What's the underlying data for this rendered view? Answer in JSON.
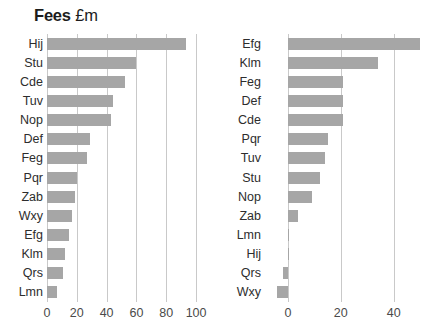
{
  "figure": {
    "background": "#ffffff",
    "bar_color": "#a6a6a6",
    "grid_color": "#c9c9c9"
  },
  "chart_data": [
    {
      "type": "bar",
      "orientation": "horizontal",
      "title": "Fees £m",
      "title_strong": "Fees",
      "title_light": "£m",
      "xlabel": "",
      "ylabel": "",
      "xlim": [
        0,
        108
      ],
      "xticks": [
        0,
        20,
        40,
        60,
        80,
        100
      ],
      "xtick_labels": [
        "0",
        "20",
        "40",
        "60",
        "80",
        "100"
      ],
      "grid": true,
      "legend": "none",
      "categories": [
        "Hij",
        "Stu",
        "Cde",
        "Tuv",
        "Nop",
        "Def",
        "Feg",
        "Pqr",
        "Zab",
        "Wxy",
        "Efg",
        "Klm",
        "Qrs",
        "Lmn"
      ],
      "values": [
        93,
        60,
        52,
        44,
        43,
        29,
        27,
        20,
        19,
        17,
        15,
        12,
        11,
        7
      ]
    },
    {
      "type": "bar",
      "orientation": "horizontal",
      "title": "Fees – growth in year %",
      "title_strong": "Fees – growth in year %",
      "title_light": "",
      "xlabel": "",
      "ylabel": "",
      "xlim": [
        -6,
        56
      ],
      "xticks": [
        0,
        20,
        40,
        60
      ],
      "xtick_labels": [
        "0",
        "20",
        "40",
        "6"
      ],
      "grid": true,
      "legend": "none",
      "categories": [
        "Efg",
        "Klm",
        "Feg",
        "Def",
        "Cde",
        "Pqr",
        "Tuv",
        "Stu",
        "Nop",
        "Zab",
        "Lmn",
        "Hij",
        "Qrs",
        "Wxy"
      ],
      "values": [
        50,
        34,
        21,
        21,
        21,
        15,
        14,
        12,
        9,
        4,
        0.3,
        0.2,
        -2,
        -4
      ]
    }
  ]
}
